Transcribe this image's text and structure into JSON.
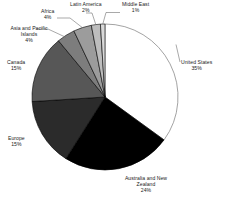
{
  "chart_data": {
    "type": "pie",
    "title": "",
    "subtitle": "",
    "xlabel": "",
    "ylabel": "",
    "legend_position": "none",
    "grid": false,
    "label_format": "name + percent",
    "start_angle_deg": 0,
    "direction": "clockwise",
    "total_percent": 100,
    "categories": [
      "United States",
      "Australia and New Zealand",
      "Europe",
      "Canada",
      "Asia and Pacific Islands",
      "Africa",
      "Latin America",
      "Middle East"
    ],
    "values": [
      35,
      24,
      15,
      15,
      4,
      4,
      2,
      1
    ],
    "slices": [
      {
        "name": "United States",
        "value": 35,
        "percent_label": "35%",
        "color": "#ffffff",
        "stroke": "#8c8c8c",
        "leader_line": false
      },
      {
        "name": "Australia and New Zealand",
        "value": 24,
        "percent_label": "24%",
        "color": "#000000",
        "stroke": "#000000",
        "leader_line": false
      },
      {
        "name": "Europe",
        "value": 15,
        "percent_label": "15%",
        "color": "#2b2b2b",
        "stroke": "#000000",
        "leader_line": false
      },
      {
        "name": "Canada",
        "value": 15,
        "percent_label": "15%",
        "color": "#575757",
        "stroke": "#000000",
        "leader_line": false
      },
      {
        "name": "Asia and Pacific Islands",
        "value": 4,
        "percent_label": "4%",
        "color": "#7d7d7d",
        "stroke": "#000000",
        "leader_line": true
      },
      {
        "name": "Africa",
        "value": 4,
        "percent_label": "4%",
        "color": "#9c9c9c",
        "stroke": "#000000",
        "leader_line": true
      },
      {
        "name": "Latin America",
        "value": 2,
        "percent_label": "2%",
        "color": "#bdbdbd",
        "stroke": "#000000",
        "leader_line": true
      },
      {
        "name": "Middle East",
        "value": 1,
        "percent_label": "1%",
        "color": "#d9d9d9",
        "stroke": "#000000",
        "leader_line": true
      }
    ]
  },
  "labels": {
    "us": {
      "name": "United States",
      "pct": "35%"
    },
    "anz": {
      "name": "Australia and New",
      "name2": "Zealand",
      "pct": "24%"
    },
    "europe": {
      "name": "Europe",
      "pct": "15%"
    },
    "canada": {
      "name": "Canada",
      "pct": "15%"
    },
    "asia": {
      "name": "Asia and Pacific",
      "name2": "Islands",
      "pct": "4%"
    },
    "africa": {
      "name": "Africa",
      "pct": "4%"
    },
    "latam": {
      "name": "Latin America",
      "pct": "2%"
    },
    "me": {
      "name": "Middle East",
      "pct": "1%"
    }
  },
  "colors": {
    "background": "#ffffff",
    "text": "#1a1a1a",
    "outline": "#8c8c8c",
    "leader": "#6e6e6e"
  }
}
